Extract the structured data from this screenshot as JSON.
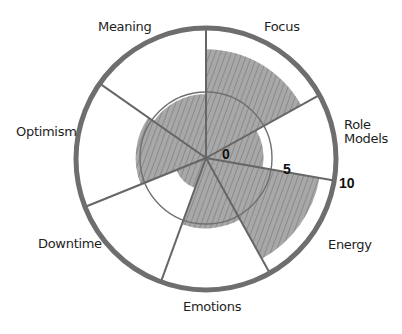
{
  "chart_data": {
    "type": "radial-bar",
    "title": "",
    "categories": [
      "Focus",
      "Role Models",
      "Energy",
      "Emotions",
      "Downtime",
      "Optimism",
      "Meaning"
    ],
    "values": [
      8.5,
      4.5,
      9,
      5.5,
      2.5,
      5.5,
      5
    ],
    "scale": {
      "min": 0,
      "max": 10,
      "ticks": [
        0,
        5,
        10
      ]
    },
    "grid_circles": [
      5,
      10
    ],
    "fill_color": "#9a9a9a",
    "line_color": "#6b6b6b"
  },
  "labels": {
    "focus": "Focus",
    "role_models": "Role\nModels",
    "energy": "Energy",
    "emotions": "Emotions",
    "downtime": "Downtime",
    "optimism": "Optimism",
    "meaning": "Meaning"
  },
  "ticks": {
    "t0": "0",
    "t5": "5",
    "t10": "10"
  }
}
